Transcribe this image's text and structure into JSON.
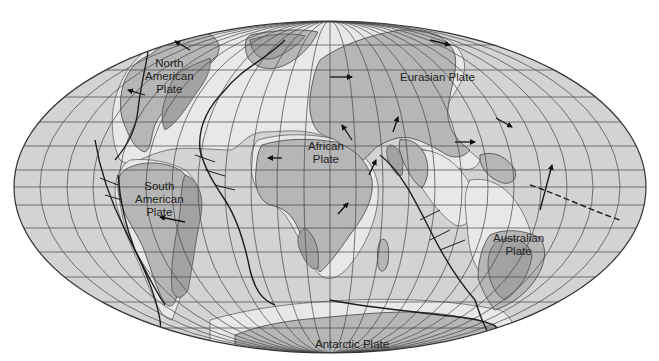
{
  "map": {
    "title": "Tectonic plates of the world",
    "projection": "mollweide-like elliptical",
    "colors": {
      "ocean": "#d3d3d3",
      "land": "#b6b6b6",
      "shield": "#a2a2a2",
      "shelf": "#e8e8e8",
      "grid": "#444444",
      "boundary": "#1e1e1e",
      "background": "#ffffff"
    },
    "plates": [
      {
        "id": "north-american",
        "line1": "North",
        "line2": "American",
        "line3": "Plate"
      },
      {
        "id": "eurasian",
        "line1": "Eurasian Plate"
      },
      {
        "id": "african",
        "line1": "African",
        "line2": "Plate"
      },
      {
        "id": "south-american",
        "line1": "South",
        "line2": "American",
        "line3": "Plate"
      },
      {
        "id": "australian",
        "line1": "Australian",
        "line2": "Plate"
      },
      {
        "id": "antarctic",
        "line1": "Antarctic Plate"
      }
    ],
    "motion_arrows": [
      {
        "plate": "north-american",
        "direction": "northwest"
      },
      {
        "plate": "north-american",
        "direction": "west"
      },
      {
        "plate": "eurasian",
        "direction": "east"
      },
      {
        "plate": "eurasian",
        "direction": "east"
      },
      {
        "plate": "eurasian",
        "direction": "southeast"
      },
      {
        "plate": "eurasian",
        "direction": "east"
      },
      {
        "plate": "african",
        "direction": "northwest"
      },
      {
        "plate": "african",
        "direction": "west"
      },
      {
        "plate": "african",
        "direction": "northeast"
      },
      {
        "plate": "arabian",
        "direction": "north"
      },
      {
        "plate": "indian",
        "direction": "northeast"
      },
      {
        "plate": "south-american",
        "direction": "west"
      },
      {
        "plate": "australian",
        "direction": "north"
      }
    ]
  }
}
